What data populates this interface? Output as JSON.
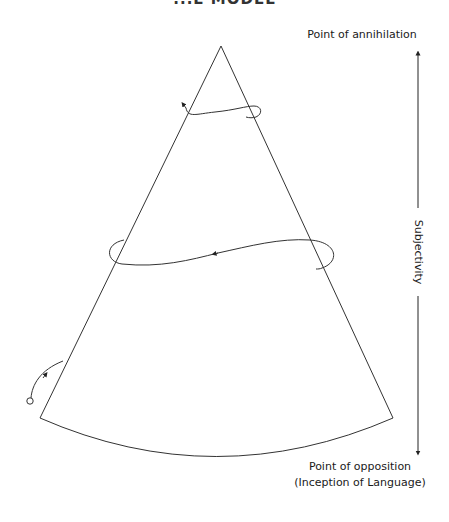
{
  "figure": {
    "title_partial": "...E MODEL",
    "labels": {
      "top": "Point of annihilation",
      "axis": "Subjectivity",
      "bottom_line1": "Point of opposition",
      "bottom_line2": "(Inception of Language)"
    }
  },
  "diagram": {
    "shape": "cone",
    "apex": [
      221,
      46
    ],
    "base_left": [
      40,
      418
    ],
    "base_right": [
      393,
      418
    ],
    "spirals": [
      "upper-loop",
      "middle-loop",
      "lower-entry-curve"
    ],
    "axis": {
      "x": 418,
      "top_arrow_y": 50,
      "bottom_arrow_y": 456
    },
    "stroke_color": "#333333"
  }
}
